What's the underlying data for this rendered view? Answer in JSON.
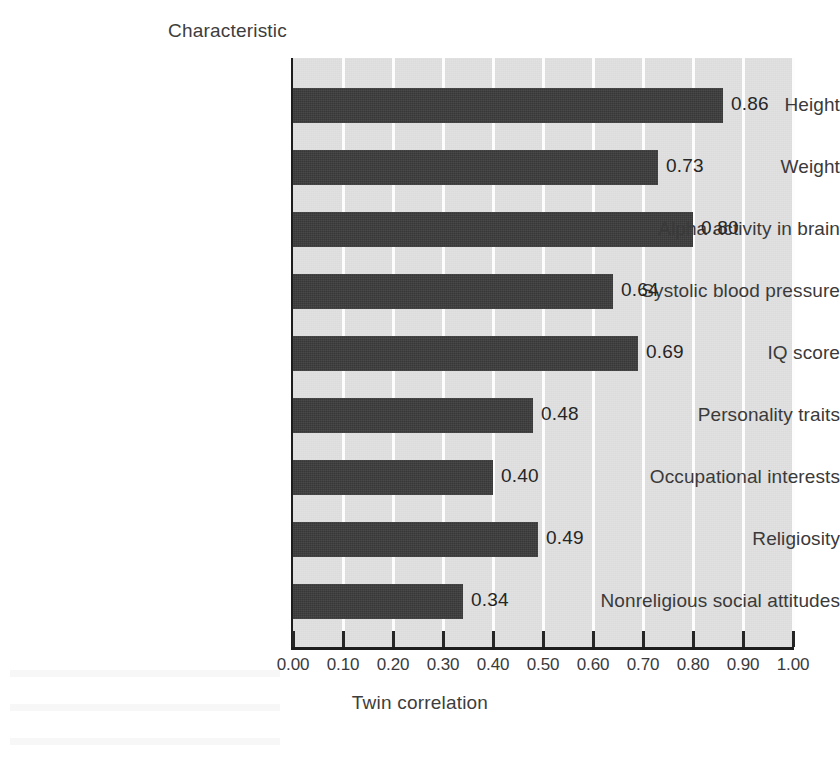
{
  "chart_data": {
    "type": "bar",
    "orientation": "horizontal",
    "title": "",
    "xlabel": "Twin correlation",
    "ylabel": "Characteristic",
    "xlim": [
      0.0,
      1.0
    ],
    "grid": true,
    "legend": null,
    "categories": [
      "Height",
      "Weight",
      "Alpha activity in brain",
      "Systolic blood pressure",
      "IQ score",
      "Personality traits",
      "Occupational interests",
      "Religiosity",
      "Nonreligious social attitudes"
    ],
    "values": [
      0.86,
      0.73,
      0.8,
      0.64,
      0.69,
      0.48,
      0.4,
      0.49,
      0.34
    ],
    "value_labels": [
      "0.86",
      "0.73",
      "0.80",
      "0.64",
      "0.69",
      "0.48",
      "0.40",
      "0.49",
      "0.34"
    ],
    "xticks": [
      0.0,
      0.1,
      0.2,
      0.3,
      0.4,
      0.5,
      0.6,
      0.7,
      0.8,
      0.9,
      1.0
    ],
    "xtick_labels": [
      "0.00",
      "0.10",
      "0.20",
      "0.30",
      "0.40",
      "0.50",
      "0.60",
      "0.70",
      "0.80",
      "0.90",
      "1.00"
    ],
    "colors": {
      "bar": "#3c3c3c",
      "plot_background": "#e1e1e1",
      "gridline": "#fdfdfd",
      "axis": "#1d1d1d",
      "text": "#3a3a3a",
      "page_background": "#ffffff"
    }
  }
}
